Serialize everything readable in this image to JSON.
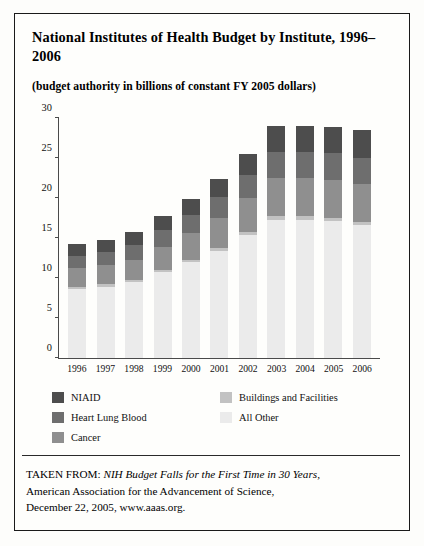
{
  "figure": {
    "title": "National Institutes of Health Budget by Institute, 1996–2006",
    "subtitle": "(budget authority in billions of constant FY 2005 dollars)"
  },
  "source": {
    "prefix": "TAKEN FROM:",
    "work": "NIH Budget Falls for the First Time in 30 Years,",
    "line2": "American Association for the Advancement of Science,",
    "line3": "December 22, 2005, www.aaas.org."
  },
  "legend": {
    "columns": [
      {
        "items": [
          {
            "label": "NIAID",
            "color": "#4d4d4d"
          },
          {
            "label": "Heart Lung Blood",
            "color": "#6e6e6e"
          },
          {
            "label": "Cancer",
            "color": "#8f8f8f"
          }
        ]
      },
      {
        "items": [
          {
            "label": "Buildings and Facilities",
            "color": "#c2c2c2"
          },
          {
            "label": "All Other",
            "color": "#ebebeb"
          }
        ]
      }
    ]
  },
  "chart_data": {
    "type": "bar",
    "subtype": "stacked-vertical",
    "title": "National Institutes of Health Budget by Institute, 1996–2006",
    "xlabel": "",
    "ylabel": "",
    "ylim": [
      0,
      30
    ],
    "yticks": [
      0,
      5,
      10,
      15,
      20,
      25,
      30
    ],
    "grid": false,
    "legend_position": "below-plot",
    "units": "billions of constant FY 2005 dollars",
    "categories": [
      "1996",
      "1997",
      "1998",
      "1999",
      "2000",
      "2001",
      "2002",
      "2003",
      "2004",
      "2005",
      "2006"
    ],
    "stack_order_bottom_to_top": [
      "All Other",
      "Buildings and Facilities",
      "Cancer",
      "Heart Lung Blood",
      "NIAID"
    ],
    "series": [
      {
        "name": "All Other",
        "color": "#ebebeb",
        "values": [
          8.6,
          8.9,
          9.5,
          10.7,
          12.0,
          13.4,
          15.4,
          17.3,
          17.2,
          17.1,
          16.6
        ]
      },
      {
        "name": "Buildings and Facilities",
        "color": "#c2c2c2",
        "values": [
          0.3,
          0.3,
          0.3,
          0.3,
          0.3,
          0.4,
          0.4,
          0.5,
          0.5,
          0.4,
          0.4
        ]
      },
      {
        "name": "Cancer",
        "color": "#8f8f8f",
        "values": [
          2.3,
          2.4,
          2.5,
          2.9,
          3.3,
          3.7,
          4.2,
          4.7,
          4.8,
          4.8,
          4.7
        ]
      },
      {
        "name": "Heart Lung Blood",
        "color": "#6e6e6e",
        "values": [
          1.6,
          1.7,
          1.8,
          2.1,
          2.3,
          2.6,
          2.9,
          3.3,
          3.3,
          3.3,
          3.3
        ]
      },
      {
        "name": "NIAID",
        "color": "#4d4d4d",
        "values": [
          1.5,
          1.5,
          1.7,
          1.8,
          2.0,
          2.3,
          2.6,
          3.2,
          3.2,
          3.3,
          3.5
        ]
      }
    ],
    "totals": [
      14.3,
      14.8,
      15.8,
      17.8,
      19.9,
      22.4,
      25.5,
      29.0,
      29.0,
      28.9,
      28.5
    ]
  }
}
